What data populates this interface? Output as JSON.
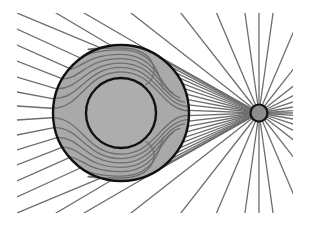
{
  "figure": {
    "width": 309,
    "height": 225,
    "clip": {
      "x": 17,
      "y": 13,
      "width": 276,
      "height": 200
    },
    "colors": {
      "background": "#ffffff",
      "field_line": "#6e6e6e",
      "sphere_fill": "#a9a9a9",
      "core_fill": "#adadad",
      "charge_fill": "#8c8c8c",
      "outline": "#111111"
    },
    "sphere": {
      "cx": 121,
      "cy": 113,
      "r": 68
    },
    "core": {
      "cx": 121,
      "cy": 113,
      "r": 35
    },
    "charge": {
      "cx": 259,
      "cy": 113,
      "r": 8.5
    },
    "radial_line_angles_deg": [
      -82,
      -67,
      -52,
      -38,
      -27,
      -18,
      -10,
      -4,
      0,
      4,
      10,
      18,
      27,
      38,
      52,
      67,
      82,
      90,
      98,
      113,
      128,
      142,
      -90,
      -98,
      -113,
      -128,
      -142
    ],
    "left_exit_y": [
      13,
      29,
      45,
      61,
      77,
      92,
      106,
      120,
      135,
      150,
      165,
      181,
      197,
      213
    ],
    "top_exit_x": [
      56,
      84
    ],
    "bottom_exit_x": [
      56,
      84
    ]
  }
}
